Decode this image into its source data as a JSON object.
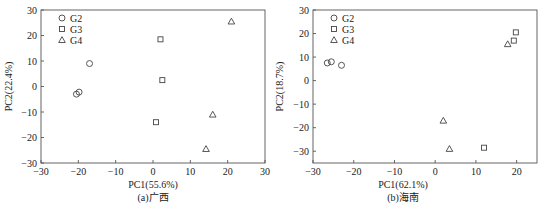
{
  "chart_data": [
    {
      "type": "scatter",
      "title": "",
      "caption": "(a)广西",
      "xlabel": "PC1(55.6%)",
      "ylabel": "PC2(22.4%)",
      "xlim": [
        -30,
        30
      ],
      "ylim": [
        -30,
        30
      ],
      "xticks": [
        -30,
        -20,
        -10,
        0,
        10,
        20,
        30
      ],
      "yticks": [
        -30,
        -20,
        -10,
        0,
        10,
        20,
        30
      ],
      "xtick_labels": [
        "−30",
        "−20",
        "−10",
        "0",
        "10",
        "20",
        "30"
      ],
      "ytick_labels": [
        "−30",
        "−20",
        "−10",
        "0",
        "10",
        "20",
        "30"
      ],
      "grid": false,
      "legend": "top-left",
      "series": [
        {
          "name": "G2",
          "marker": "circle",
          "points": [
            [
              -17,
              9
            ],
            [
              -20.5,
              -3
            ],
            [
              -19.8,
              -2.2
            ]
          ]
        },
        {
          "name": "G3",
          "marker": "square",
          "points": [
            [
              2,
              18.5
            ],
            [
              2.5,
              2.5
            ],
            [
              0.8,
              -14
            ]
          ]
        },
        {
          "name": "G4",
          "marker": "triangle",
          "points": [
            [
              21,
              25.5
            ],
            [
              16,
              -11
            ],
            [
              14.2,
              -24.5
            ]
          ]
        }
      ]
    },
    {
      "type": "scatter",
      "title": "",
      "caption": "(b)海南",
      "xlabel": "PC1(62.1%)",
      "ylabel": "PC2(18.7%)",
      "xlim": [
        -30,
        25
      ],
      "ylim": [
        -35,
        30
      ],
      "xticks": [
        -30,
        -20,
        -10,
        0,
        10,
        20
      ],
      "yticks": [
        -30,
        -20,
        -10,
        0,
        10,
        20,
        30
      ],
      "xtick_labels": [
        "−30",
        "−20",
        "−10",
        "0",
        "10",
        "20"
      ],
      "ytick_labels": [
        "−30",
        "−20",
        "−10",
        "0",
        "10",
        "20",
        "30"
      ],
      "grid": false,
      "legend": "top-left",
      "series": [
        {
          "name": "G2",
          "marker": "circle",
          "points": [
            [
              -26.5,
              7.5
            ],
            [
              -25.5,
              8
            ],
            [
              -23,
              6.5
            ]
          ]
        },
        {
          "name": "G3",
          "marker": "square",
          "points": [
            [
              19.8,
              20.5
            ],
            [
              19.3,
              17
            ],
            [
              12,
              -28.5
            ]
          ]
        },
        {
          "name": "G4",
          "marker": "triangle",
          "points": [
            [
              17.8,
              15.5
            ],
            [
              2,
              -17
            ],
            [
              3.5,
              -29
            ]
          ]
        }
      ]
    }
  ]
}
